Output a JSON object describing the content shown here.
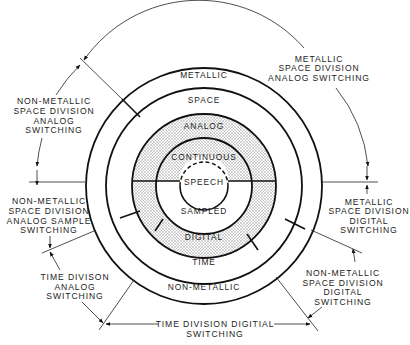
{
  "diagram": {
    "rings": {
      "outer_top": "METALLIC",
      "outer_bottom": "NON-METALLIC",
      "second_top": "SPACE",
      "second_bottom": "TIME",
      "third_top": "ANALOG",
      "third_bottom": "DIGITAL",
      "inner_top": "CONTINUOUS",
      "inner_bottom": "SAMPLED",
      "center": "SPEECH"
    },
    "callouts": {
      "metallic_space_analog": [
        "METALLIC",
        "SPACE DIVISION",
        "ANALOG SWITCHING"
      ],
      "nonmetallic_space_analog": [
        "NON-METALLIC",
        "SPACE DIVISION",
        "ANALOG",
        "SWITCHING"
      ],
      "nonmetallic_space_analog_sample": [
        "NON-METALLIC",
        "SPACE DIVISION",
        "ANALOG SAMPLE",
        "SWITCHING"
      ],
      "time_division_analog": [
        "TIME DIVISON",
        "ANALOG",
        "SWITCHING"
      ],
      "time_division_digital": [
        "TIME DIVISION DIGITIAL",
        "SWITCHING"
      ],
      "nonmetallic_space_digital": [
        "NON-METALLIC",
        "SPACE DIVISION",
        "DIGITAL",
        "SWITCHING"
      ],
      "metallic_space_digital": [
        "METALLIC",
        "SPACE DIVISION",
        "DIGITAL",
        "SWITCHING"
      ]
    },
    "colors": {
      "line": "#111111",
      "shade": "#d9d9d9",
      "background": "#ffffff"
    }
  }
}
